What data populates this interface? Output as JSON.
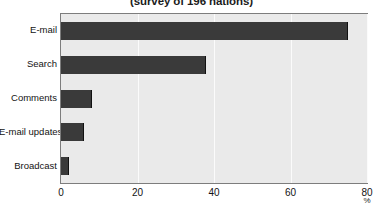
{
  "chart_data": {
    "type": "bar",
    "orientation": "horizontal",
    "title": "(survey of 196 nations)",
    "xlabel": "%",
    "ylabel": "",
    "categories": [
      "E-mail",
      "Search",
      "Comments",
      "E-mail updates",
      "Broadcast"
    ],
    "values": [
      75,
      38,
      8,
      6,
      2
    ],
    "series": [
      {
        "name": "share of nations",
        "values": [
          75,
          38,
          8,
          6,
          2
        ]
      }
    ],
    "xlim": [
      0,
      80
    ],
    "xticks": [
      0,
      20,
      40,
      60,
      80
    ],
    "xtick_labels": [
      "0",
      "20",
      "40",
      "60",
      "80"
    ],
    "grid": true,
    "legend": false,
    "colors": {
      "bar": "#3a3a3a",
      "plot_background": "#eaeaea",
      "gridline": "#fbfbfb",
      "frame": "#7d7d7d",
      "text": "#131313",
      "page_background": "#ffffff"
    }
  }
}
